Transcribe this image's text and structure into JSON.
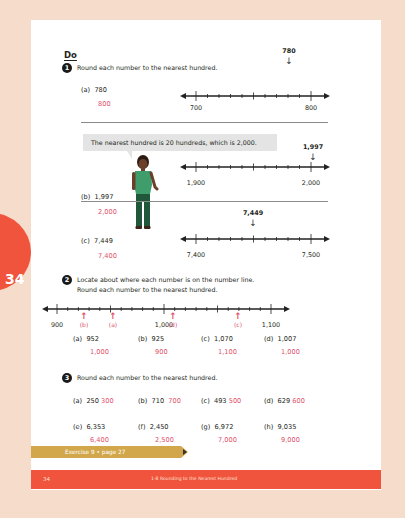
{
  "page": {
    "side_tab_number": "34",
    "section_heading": "Do",
    "footer": {
      "page_number": "34",
      "title": "1-8 Rounding to the Nearest Hundred"
    },
    "exercise_link": "Exercise 9 • page 27"
  },
  "colors": {
    "background": "#f6dccb",
    "accent_red": "#f0543c",
    "answer_pink": "#e0506a",
    "exercise_gold": "#d2a74b",
    "bubble_gray": "#e4e4e4"
  },
  "q1": {
    "number": "1",
    "instruction": "Round each number to the nearest hundred.",
    "speech_bubble": "The nearest hundred is 20 hundreds, which is 2,000.",
    "parts": [
      {
        "label": "(a)",
        "value": "780",
        "answer": "800",
        "line_start": "700",
        "line_end": "800",
        "marker": "780",
        "marker_fraction": 0.8
      },
      {
        "label": "(b)",
        "value": "1,997",
        "answer": "2,000",
        "line_start": "1,900",
        "line_end": "2,000",
        "marker": "1,997",
        "marker_fraction": 0.97
      },
      {
        "label": "(c)",
        "value": "7,449",
        "answer": "7,400",
        "line_start": "7,400",
        "line_end": "7,500",
        "marker": "7,449",
        "marker_fraction": 0.49
      }
    ]
  },
  "q2": {
    "number": "2",
    "instruction_line1": "Locate about where each number is on the number line.",
    "instruction_line2": "Round each number to the nearest hundred.",
    "line_labels": [
      "900",
      "1,000",
      "1,100"
    ],
    "arrows": [
      {
        "label": "(b)",
        "value": 925
      },
      {
        "label": "(a)",
        "value": 952
      },
      {
        "label": "(d)",
        "value": 1007
      },
      {
        "label": "(c)",
        "value": 1070
      }
    ],
    "parts": [
      {
        "label": "(a)",
        "value": "952",
        "answer": "1,000"
      },
      {
        "label": "(b)",
        "value": "925",
        "answer": "900"
      },
      {
        "label": "(c)",
        "value": "1,070",
        "answer": "1,100"
      },
      {
        "label": "(d)",
        "value": "1,007",
        "answer": "1,000"
      }
    ]
  },
  "q3": {
    "number": "3",
    "instruction": "Round each number to the nearest hundred.",
    "parts": [
      {
        "label": "(a)",
        "value": "250",
        "answer": "300"
      },
      {
        "label": "(b)",
        "value": "710",
        "answer": "700"
      },
      {
        "label": "(c)",
        "value": "493",
        "answer": "500"
      },
      {
        "label": "(d)",
        "value": "629",
        "answer": "600"
      },
      {
        "label": "(e)",
        "value": "6,353",
        "answer": "6,400"
      },
      {
        "label": "(f)",
        "value": "2,450",
        "answer": "2,500"
      },
      {
        "label": "(g)",
        "value": "6,972",
        "answer": "7,000"
      },
      {
        "label": "(h)",
        "value": "9,035",
        "answer": "9,000"
      }
    ]
  }
}
